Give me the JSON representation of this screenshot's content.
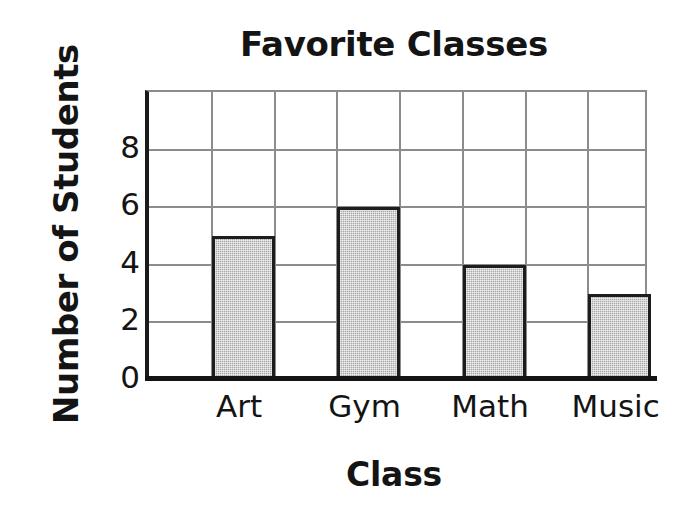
{
  "chart_data": {
    "type": "bar",
    "title": "Favorite Classes",
    "xlabel": "Class",
    "ylabel": "Number of Students",
    "categories": [
      "Art",
      "Gym",
      "Math",
      "Music"
    ],
    "values": [
      5,
      6,
      4,
      3
    ],
    "ytick_labels": [
      "0",
      "2",
      "4",
      "6",
      "8"
    ],
    "ytick_values": [
      0,
      2,
      4,
      6,
      8
    ],
    "ylim": [
      0,
      10
    ],
    "grid": true,
    "grid_columns": 8,
    "legend": "none",
    "colors": {
      "bar_fill": "#a9a9a9",
      "bar_outline": "#1d1d1d",
      "gridline": "#8c8c8c",
      "axis": "#141414",
      "background": "#ffffff",
      "text": "#141414"
    }
  }
}
